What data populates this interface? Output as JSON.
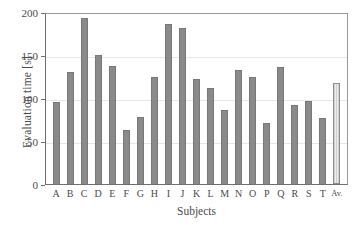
{
  "chart_data": {
    "type": "bar",
    "title": "",
    "xlabel": "Subjects",
    "ylabel": "Evaluation time [s]",
    "ylim": [
      0,
      200
    ],
    "yticks": [
      0,
      50,
      100,
      150,
      200
    ],
    "grid": true,
    "legend": "none",
    "categories": [
      "A",
      "B",
      "C",
      "D",
      "E",
      "F",
      "G",
      "H",
      "I",
      "J",
      "K",
      "L",
      "M",
      "N",
      "O",
      "P",
      "Q",
      "R",
      "S",
      "T",
      "Av."
    ],
    "values": [
      95,
      130,
      193,
      150,
      137,
      63,
      78,
      124,
      186,
      181,
      122,
      112,
      86,
      133,
      124,
      71,
      136,
      92,
      96,
      77,
      118
    ],
    "series": [
      {
        "name": "Evaluation time",
        "values": [
          95,
          130,
          193,
          150,
          137,
          63,
          78,
          124,
          186,
          181,
          122,
          112,
          86,
          133,
          124,
          71,
          136,
          92,
          96,
          77,
          118
        ]
      }
    ],
    "highlight_category": "Av.",
    "colors": {
      "bar": "#8a8a8a",
      "bar_edge": "#777777",
      "average_bar": "#d8d8d8",
      "average_bar_edge": "#8d8d8d",
      "grid": "#e6e6e6",
      "axis": "#6f6f6f",
      "text": "#4a4a4a",
      "background": "#ffffff"
    }
  }
}
